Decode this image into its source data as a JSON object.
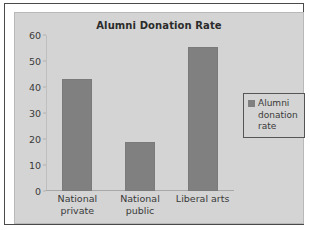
{
  "chart_data": {
    "type": "bar",
    "title": "Alumni Donation Rate",
    "categories": [
      "National private",
      "National public",
      "Liberal arts"
    ],
    "values": [
      43,
      19,
      55.5
    ],
    "series": [
      {
        "name": "Alumni donation rate",
        "values": [
          43,
          19,
          55.5
        ]
      }
    ],
    "xlabel": "",
    "ylabel": "",
    "ylim": [
      0,
      60
    ],
    "ytick_labels": [
      "0",
      "10",
      "20",
      "30",
      "40",
      "50",
      "60"
    ],
    "ytick_values": [
      0,
      10,
      20,
      30,
      40,
      50,
      60
    ],
    "grid": false,
    "legend_position": "right",
    "colors": {
      "bar": "#808080",
      "plot_background": "#d4d4d4",
      "page_background": "#ffffff",
      "frame_border": "#4a4a4a",
      "text": "#3a3a3a",
      "title_text": "#2b2b2b"
    }
  },
  "legend": {
    "entries": [
      {
        "label_lines": [
          "Alumni",
          "donation",
          "rate"
        ],
        "swatch_name": "legend-swatch-alumni-donation-rate"
      }
    ]
  },
  "category_label_lines": [
    [
      "National",
      "private"
    ],
    [
      "National",
      "public"
    ],
    [
      "Liberal arts"
    ]
  ]
}
